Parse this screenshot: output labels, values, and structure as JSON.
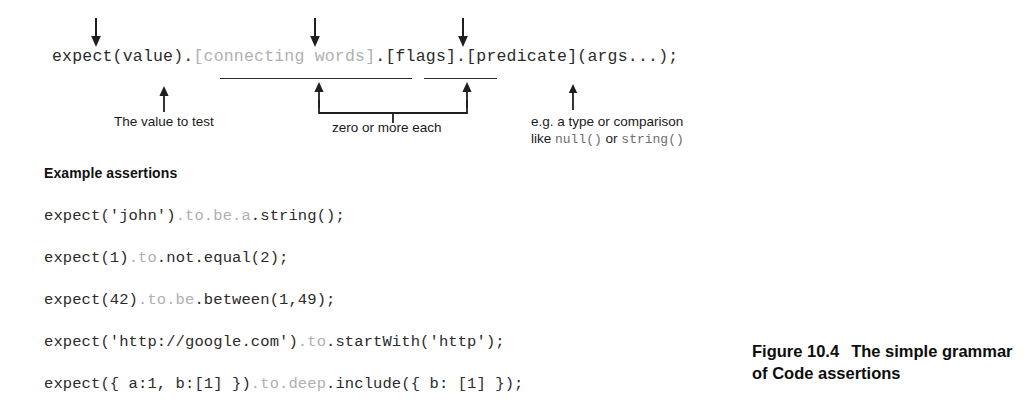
{
  "figure": {
    "caption_label": "Figure 10.4",
    "caption_text": "The simple grammar of Code assertions"
  },
  "grammar": {
    "segments": [
      {
        "text": "expect(value).",
        "dim": false
      },
      {
        "text": "[connecting words]",
        "dim": true
      },
      {
        "text": ".[flags].[predicate](args...);",
        "dim": false
      }
    ],
    "full_text": "expect(value).[connecting words].[flags].[predicate](args...);"
  },
  "callouts": {
    "down_arrows": [
      {
        "name": "down-arrow-value",
        "x": 90,
        "y": 18
      },
      {
        "name": "down-arrow-connecting-words",
        "x": 309,
        "y": 18
      },
      {
        "name": "down-arrow-flags",
        "x": 457,
        "y": 18
      }
    ],
    "rules": [
      {
        "name": "underline-connecting-words",
        "x": 220,
        "y": 78,
        "width": 192
      },
      {
        "name": "underline-flags",
        "x": 424,
        "y": 78,
        "width": 73
      }
    ],
    "up_arrows": [
      {
        "name": "up-arrow-value-to-test",
        "x": 158,
        "y": 86
      },
      {
        "name": "up-arrow-connecting-words",
        "x": 313,
        "y": 82
      },
      {
        "name": "up-arrow-flags",
        "x": 461,
        "y": 82
      },
      {
        "name": "up-arrow-predicate",
        "x": 567,
        "y": 84
      }
    ],
    "labels": {
      "value_to_test": "The value to test",
      "zero_or_more": "zero or more each",
      "predicate_line1": "e.g. a type or comparison",
      "predicate_line2_pre": "like ",
      "predicate_null": "null()",
      "predicate_line2_mid": " or ",
      "predicate_string": "string()"
    }
  },
  "examples": {
    "heading": "Example assertions",
    "lines": [
      {
        "name": "assertion-string",
        "y": 207,
        "segments": [
          {
            "text": "expect('john')",
            "dim": false
          },
          {
            "text": ".to.be.a",
            "dim": true
          },
          {
            "text": ".string();",
            "dim": false
          }
        ],
        "full_text": "expect('john').to.be.a.string();"
      },
      {
        "name": "assertion-not-equal",
        "y": 249,
        "segments": [
          {
            "text": "expect(1)",
            "dim": false
          },
          {
            "text": ".to",
            "dim": true
          },
          {
            "text": ".not.equal(2);",
            "dim": false
          }
        ],
        "full_text": "expect(1).to.not.equal(2);"
      },
      {
        "name": "assertion-between",
        "y": 291,
        "segments": [
          {
            "text": "expect(42)",
            "dim": false
          },
          {
            "text": ".to.be",
            "dim": true
          },
          {
            "text": ".between(1,49);",
            "dim": false
          }
        ],
        "full_text": "expect(42).to.be.between(1,49);"
      },
      {
        "name": "assertion-start-with",
        "y": 333,
        "segments": [
          {
            "text": "expect('http://google.com')",
            "dim": false
          },
          {
            "text": ".to",
            "dim": true
          },
          {
            "text": ".startWith('http');",
            "dim": false
          }
        ],
        "full_text": "expect('http://google.com').to.startWith('http');"
      },
      {
        "name": "assertion-deep-include",
        "y": 375,
        "segments": [
          {
            "text": "expect({ a:1, b:[1] })",
            "dim": false
          },
          {
            "text": ".to.deep",
            "dim": true
          },
          {
            "text": ".include({ b: [1] });",
            "dim": false
          }
        ],
        "full_text": "expect({ a:1, b:[1] }).to.deep.include({ b: [1] });"
      }
    ]
  },
  "colors": {
    "ink": "#2b2b2b",
    "dim_ink": "#b0b0b0",
    "caption_ink": "#0d0d0d",
    "background": "#ffffff"
  }
}
